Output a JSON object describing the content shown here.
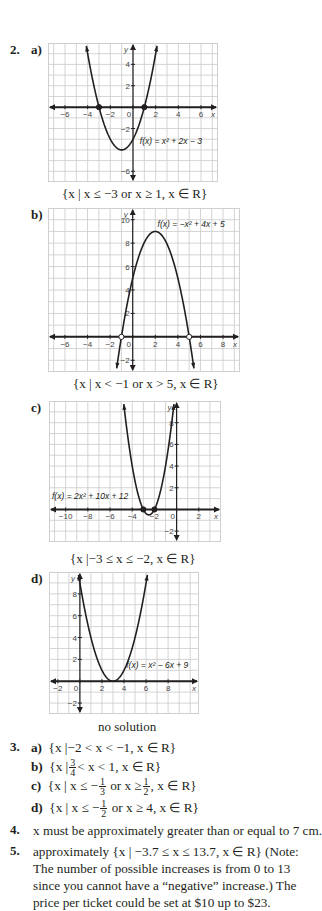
{
  "q2": {
    "number": "2.",
    "parts": [
      {
        "label": "a)",
        "caption": "{x | x ≤ −3 or x ≥ 1, x ∈ R}"
      },
      {
        "label": "b)",
        "caption": "{x | x < −1 or x > 5, x ∈ R}"
      },
      {
        "label": "c)",
        "caption": "{x |−3 ≤ x ≤ −2, x ∈ R}"
      },
      {
        "label": "d)",
        "caption": "no solution"
      }
    ]
  },
  "q3": {
    "number": "3.",
    "parts": [
      {
        "label": "a)",
        "text": "{x |−2 < x < −1, x ∈ R}"
      },
      {
        "label": "b)",
        "pre": "{x |",
        "frac": [
          "3",
          "4"
        ],
        "post": "< x < 1, x ∈ R}"
      },
      {
        "label": "c)",
        "pre": "{x | x ≤ −",
        "frac": [
          "1",
          "3"
        ],
        "mid": "or x ≥",
        "frac2": [
          "1",
          "2"
        ],
        "post": ", x ∈ R}"
      },
      {
        "label": "d)",
        "pre": "{x | x ≤ −",
        "frac": [
          "1",
          "2"
        ],
        "post": "or x ≥ 4, x ∈ R}"
      }
    ]
  },
  "q4": {
    "number": "4.",
    "text": "x must be approximately greater than or equal to 7 cm."
  },
  "q5": {
    "number": "5.",
    "lines": [
      "approximately {x | −3.7 ≤ x ≤ 13.7, x ∈ R} (Note:",
      "The number of possible increases is from 0 to 13",
      "since you cannot have a “negative” increase.) The",
      "price per ticket could be set at $10 up to $23."
    ]
  },
  "chart_data": [
    {
      "type": "line",
      "title": "f(x) = x² + 2x − 3",
      "label": "f(x) = x² + 2x − 3",
      "coef": [
        1,
        2,
        -3
      ],
      "xlim": [
        -7.5,
        7.5
      ],
      "ylim": [
        -7,
        6
      ],
      "grid": true,
      "xticks": [
        -6,
        -4,
        -2,
        0,
        2,
        4,
        6
      ],
      "yticks": [
        -6,
        -2,
        2,
        4
      ],
      "xlabel": "x",
      "ylabel": "y",
      "roots": [
        -3,
        1
      ],
      "root_style": "closed",
      "vertex": [
        -1,
        -4
      ]
    },
    {
      "type": "line",
      "title": "f(x) = −x² + 4x + 5",
      "label": "f(x) = −x² + 4x + 5",
      "coef": [
        -1,
        4,
        5
      ],
      "xlim": [
        -7.5,
        9.5
      ],
      "ylim": [
        -3,
        11
      ],
      "grid": true,
      "xticks": [
        -6,
        -4,
        -2,
        0,
        2,
        4,
        6,
        8
      ],
      "yticks": [
        -2,
        2,
        4,
        6,
        8,
        10
      ],
      "xlabel": "x",
      "ylabel": "y",
      "roots": [
        -1,
        5
      ],
      "root_style": "open",
      "vertex": [
        2,
        9
      ]
    },
    {
      "type": "line",
      "title": "f(x) = 2x² + 10x + 12",
      "label": "f(x) = 2x² + 10x + 12",
      "coef": [
        2,
        10,
        12
      ],
      "xlim": [
        -11.5,
        4
      ],
      "ylim": [
        -3,
        10
      ],
      "grid": true,
      "xticks": [
        -10,
        -8,
        -6,
        -4,
        -2,
        0,
        2
      ],
      "yticks": [
        -2,
        2,
        4,
        6,
        8
      ],
      "xlabel": "x",
      "ylabel": "y",
      "roots": [
        -3,
        -2
      ],
      "root_style": "closed",
      "vertex": [
        -2.5,
        -0.5
      ]
    },
    {
      "type": "line",
      "title": "f(x) = x² − 6x + 9",
      "label": "f(x) = x² − 6x + 9",
      "coef": [
        1,
        -6,
        9
      ],
      "xlim": [
        -2.8,
        10.8
      ],
      "ylim": [
        -3,
        10
      ],
      "grid": true,
      "xticks": [
        -2,
        0,
        2,
        4,
        6,
        8
      ],
      "yticks": [
        -2,
        2,
        4,
        6,
        8
      ],
      "xlabel": "x",
      "ylabel": "y",
      "roots": [
        3
      ],
      "root_style": "none",
      "vertex": [
        3,
        0
      ]
    }
  ]
}
